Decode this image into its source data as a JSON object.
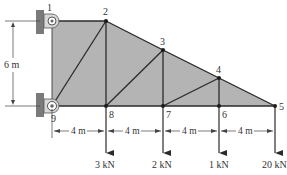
{
  "diagram": {
    "colors": {
      "panel_fill": "#b4b4b4",
      "member": "#2a2a2a",
      "wall": "#7a7a7a",
      "dimension": "#444444",
      "text": "#333333"
    },
    "nodes": [
      {
        "id": "1",
        "label": "1",
        "x": 52,
        "y": 21
      },
      {
        "id": "2",
        "label": "2",
        "x": 106,
        "y": 21
      },
      {
        "id": "3",
        "label": "3",
        "x": 163,
        "y": 50
      },
      {
        "id": "4",
        "label": "4",
        "x": 219,
        "y": 78
      },
      {
        "id": "5",
        "label": "5",
        "x": 275,
        "y": 106
      },
      {
        "id": "6",
        "label": "6",
        "x": 219,
        "y": 106
      },
      {
        "id": "7",
        "label": "7",
        "x": 163,
        "y": 106
      },
      {
        "id": "8",
        "label": "8",
        "x": 106,
        "y": 106
      },
      {
        "id": "9",
        "label": "9",
        "x": 52,
        "y": 106
      }
    ],
    "members": [
      [
        "1",
        "2"
      ],
      [
        "2",
        "3"
      ],
      [
        "3",
        "4"
      ],
      [
        "4",
        "5"
      ],
      [
        "9",
        "8"
      ],
      [
        "8",
        "7"
      ],
      [
        "7",
        "6"
      ],
      [
        "6",
        "5"
      ],
      [
        "1",
        "9"
      ],
      [
        "2",
        "8"
      ],
      [
        "3",
        "7"
      ],
      [
        "4",
        "6"
      ],
      [
        "9",
        "2"
      ],
      [
        "8",
        "3"
      ],
      [
        "7",
        "4"
      ]
    ],
    "supports": [
      {
        "node": "1",
        "type": "pin",
        "label": "1"
      },
      {
        "node": "9",
        "type": "pin",
        "label": "9"
      }
    ],
    "dimensions": {
      "height": {
        "label": "6 m"
      },
      "spans": [
        {
          "label": "4 m"
        },
        {
          "label": "4 m"
        },
        {
          "label": "4 m"
        },
        {
          "label": "4 m"
        }
      ]
    },
    "loads": [
      {
        "node": "8",
        "label": "3 kN"
      },
      {
        "node": "7",
        "label": "2 kN"
      },
      {
        "node": "6",
        "label": "1 kN"
      },
      {
        "node": "5",
        "label": "20 kN"
      }
    ]
  }
}
